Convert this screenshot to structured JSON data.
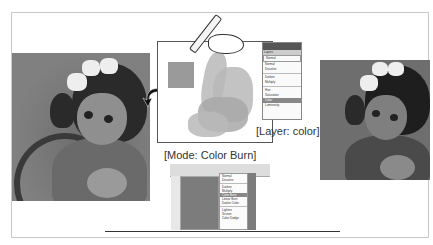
{
  "captions": {
    "mode": "[Mode: Color Burn]",
    "layer": "[Layer: color]"
  },
  "layers_panel": {
    "tab": "Layers",
    "mode_select": "Normal",
    "items": [
      "Normal",
      "Dissolve",
      "Darken",
      "Multiply",
      "Hue",
      "Saturation",
      "Color",
      "Luminosity"
    ],
    "selected": "Color"
  },
  "photoshop_window": {
    "blend_menu_items": [
      "Normal",
      "Dissolve",
      "Darken",
      "Multiply",
      "Color Burn",
      "Linear Burn",
      "Darker Color",
      "Lighten",
      "Screen",
      "Color Dodge"
    ],
    "selected": "Color Burn"
  },
  "figures": {
    "before": "portrait-before",
    "after": "portrait-after"
  }
}
